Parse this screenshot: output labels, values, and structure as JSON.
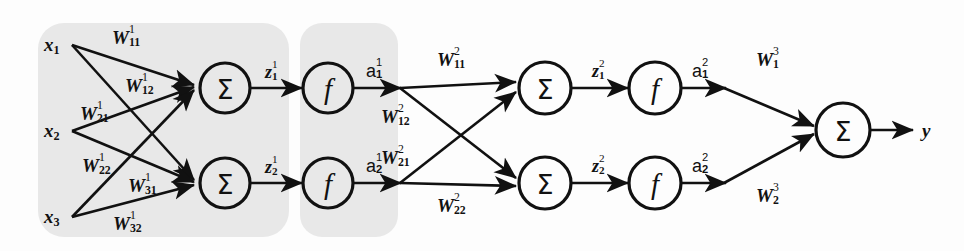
{
  "figure": {
    "type": "neural-network-diagram",
    "background_color": "#fdfdfd",
    "panel_color": "#e8e8e8",
    "stroke_color": "#111111"
  },
  "inputs": [
    {
      "name": "x1",
      "base": "x",
      "sub": "1"
    },
    {
      "name": "x2",
      "base": "x",
      "sub": "2"
    },
    {
      "name": "x3",
      "base": "x",
      "sub": "3"
    }
  ],
  "layer1_weights": [
    {
      "name": "W11_1",
      "base": "W",
      "sub": "11",
      "sup": "1"
    },
    {
      "name": "W12_1",
      "base": "W",
      "sub": "12",
      "sup": "1"
    },
    {
      "name": "W21_1",
      "base": "W",
      "sub": "21",
      "sup": "1"
    },
    {
      "name": "W22_1",
      "base": "W",
      "sub": "22",
      "sup": "1"
    },
    {
      "name": "W31_1",
      "base": "W",
      "sub": "31",
      "sup": "1"
    },
    {
      "name": "W32_1",
      "base": "W",
      "sub": "32",
      "sup": "1"
    }
  ],
  "layer1_sums": [
    {
      "glyph": "Σ"
    },
    {
      "glyph": "Σ"
    }
  ],
  "layer1_preactivations": [
    {
      "name": "z1_1",
      "base": "z",
      "sub": "1",
      "sup": "1"
    },
    {
      "name": "z2_1",
      "base": "z",
      "sub": "2",
      "sup": "1"
    }
  ],
  "layer1_activations_fn": [
    {
      "glyph": "f"
    },
    {
      "glyph": "f"
    }
  ],
  "layer1_outputs": [
    {
      "name": "a1_1",
      "base": "a",
      "sub": "1",
      "sup": "1"
    },
    {
      "name": "a2_1",
      "base": "a",
      "sub": "2",
      "sup": "1"
    }
  ],
  "layer2_weights": [
    {
      "name": "W11_2",
      "base": "W",
      "sub": "11",
      "sup": "2"
    },
    {
      "name": "W12_2",
      "base": "W",
      "sub": "12",
      "sup": "2"
    },
    {
      "name": "W21_2",
      "base": "W",
      "sub": "21",
      "sup": "2"
    },
    {
      "name": "W22_2",
      "base": "W",
      "sub": "22",
      "sup": "2"
    }
  ],
  "layer2_sums": [
    {
      "glyph": "Σ"
    },
    {
      "glyph": "Σ"
    }
  ],
  "layer2_preactivations": [
    {
      "name": "z1_2",
      "base": "z",
      "sub": "1",
      "sup": "2"
    },
    {
      "name": "z2_2",
      "base": "z",
      "sub": "2",
      "sup": "2"
    }
  ],
  "layer2_activations_fn": [
    {
      "glyph": "f"
    },
    {
      "glyph": "f"
    }
  ],
  "layer2_outputs": [
    {
      "name": "a1_2",
      "base": "a",
      "sub": "1",
      "sup": "2"
    },
    {
      "name": "a2_2",
      "base": "a",
      "sub": "2",
      "sup": "2"
    }
  ],
  "layer3_weights": [
    {
      "name": "W1_3",
      "base": "W",
      "sub": "1",
      "sup": "3"
    },
    {
      "name": "W2_3",
      "base": "W",
      "sub": "2",
      "sup": "3"
    }
  ],
  "output_sum": {
    "glyph": "Σ"
  },
  "output": {
    "name": "y",
    "base": "y",
    "sub": "",
    "sup": ""
  }
}
